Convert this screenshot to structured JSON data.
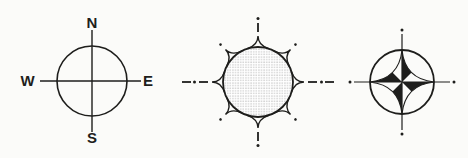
{
  "colors": {
    "ink": "#1e1e1c",
    "paper": "#fbfbf9",
    "stipple": "#8e8e8e"
  },
  "figures": {
    "compass_rose": {
      "labels": {
        "north": "N",
        "east": "E",
        "south": "S",
        "west": "W"
      }
    },
    "sun_symbol": {
      "ray_count": 8
    },
    "compass_star": {
      "point_count": 4
    }
  }
}
